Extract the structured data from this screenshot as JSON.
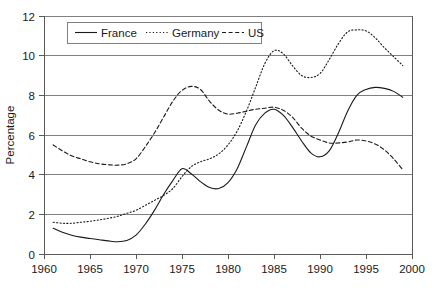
{
  "chart_data": {
    "type": "line",
    "title": "",
    "xlabel": "",
    "ylabel": "Percentage",
    "xlim": [
      1960,
      2000
    ],
    "ylim": [
      0,
      12
    ],
    "grid": "horizontal",
    "legend_position": "top-left-inside",
    "x_ticks": [
      "1960",
      "1965",
      "1970",
      "1975",
      "1980",
      "1985",
      "1990",
      "1995",
      "2000"
    ],
    "y_ticks": [
      "0",
      "2",
      "4",
      "6",
      "8",
      "10",
      "12"
    ],
    "x": [
      1961,
      1962,
      1963,
      1964,
      1965,
      1966,
      1967,
      1968,
      1969,
      1970,
      1971,
      1972,
      1973,
      1974,
      1975,
      1976,
      1977,
      1978,
      1979,
      1980,
      1981,
      1982,
      1983,
      1984,
      1985,
      1986,
      1987,
      1988,
      1989,
      1990,
      1991,
      1992,
      1993,
      1994,
      1995,
      1996,
      1997,
      1998,
      1999
    ],
    "series": [
      {
        "name": "France",
        "style": "solid",
        "color": "#1a1a1a",
        "values": [
          1.3,
          1.1,
          0.95,
          0.85,
          0.78,
          0.72,
          0.66,
          0.62,
          0.68,
          0.95,
          1.5,
          2.2,
          3.0,
          3.7,
          4.3,
          4.05,
          3.65,
          3.35,
          3.3,
          3.6,
          4.3,
          5.4,
          6.5,
          7.1,
          7.3,
          7.0,
          6.4,
          5.7,
          5.1,
          4.9,
          5.2,
          6.1,
          7.2,
          8.0,
          8.3,
          8.4,
          8.35,
          8.2,
          7.9
        ]
      },
      {
        "name": "Germany",
        "style": "dotted",
        "color": "#1a1a1a",
        "values": [
          1.6,
          1.55,
          1.55,
          1.6,
          1.65,
          1.72,
          1.8,
          1.9,
          2.05,
          2.2,
          2.45,
          2.7,
          2.95,
          3.3,
          3.9,
          4.4,
          4.65,
          4.8,
          5.05,
          5.5,
          6.2,
          7.2,
          8.4,
          9.6,
          10.25,
          10.1,
          9.5,
          9.0,
          8.9,
          9.1,
          9.8,
          10.6,
          11.2,
          11.3,
          11.25,
          10.9,
          10.4,
          9.95,
          9.5
        ]
      },
      {
        "name": "US",
        "style": "dashed",
        "color": "#1a1a1a",
        "values": [
          5.5,
          5.2,
          4.95,
          4.8,
          4.65,
          4.55,
          4.5,
          4.48,
          4.55,
          4.8,
          5.4,
          6.1,
          6.9,
          7.7,
          8.25,
          8.45,
          8.3,
          7.7,
          7.25,
          7.05,
          7.1,
          7.2,
          7.3,
          7.35,
          7.4,
          7.25,
          6.9,
          6.35,
          5.95,
          5.75,
          5.6,
          5.6,
          5.65,
          5.75,
          5.7,
          5.55,
          5.25,
          4.8,
          4.25
        ]
      }
    ]
  },
  "legend": {
    "items": [
      {
        "label": "France"
      },
      {
        "label": "Germany"
      },
      {
        "label": "US"
      }
    ]
  },
  "axes": {
    "y_title": "Percentage"
  }
}
